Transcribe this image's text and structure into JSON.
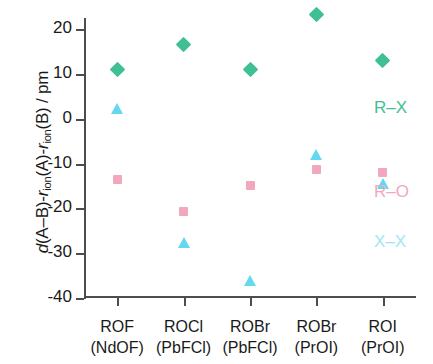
{
  "chart_data": {
    "type": "scatter",
    "title": "",
    "xlabel": "",
    "ylabel": "d(A-B)-r_ion(A)-r_ion(B) / pm",
    "ylabel_parts": {
      "italic_d": "d",
      "rest_1": "(A–B)-",
      "r_1": "r",
      "sub_1": "ion",
      "rest_2": "(A)-",
      "r_2": "r",
      "sub_2": "ion",
      "rest_3": "(B) / pm"
    },
    "categories": [
      {
        "line1": "ROF",
        "line2": "(NdOF)"
      },
      {
        "line1": "ROCl",
        "line2": "(PbFCl)"
      },
      {
        "line1": "ROBr",
        "line2": "(PbFCl)"
      },
      {
        "line1": "ROBr",
        "line2": "(PrOI)"
      },
      {
        "line1": "ROI",
        "line2": "(PrOI)"
      }
    ],
    "ylim": [
      -40,
      20
    ],
    "yticks": [
      20,
      10,
      0,
      -10,
      -20,
      -30,
      -40
    ],
    "ytick_labels": [
      "20",
      "10",
      "0",
      "-10",
      "-20",
      "-30",
      "-40"
    ],
    "grid": false,
    "legend_position": "right-inside",
    "series": [
      {
        "name": "R–X",
        "marker": "diamond",
        "color": "#3fbf93",
        "values": [
          11.0,
          16.6,
          11.0,
          23.3,
          13.0
        ]
      },
      {
        "name": "R–O",
        "marker": "square",
        "color": "#f2a7bd",
        "values": [
          -13.5,
          -20.8,
          -15.0,
          -11.3,
          -12.0
        ]
      },
      {
        "name": "X–X",
        "marker": "triangle",
        "color": "#63d8f0",
        "values": [
          2.2,
          -27.7,
          -36.3,
          -8.0,
          -14.5
        ]
      }
    ],
    "legend": [
      {
        "label": "R–X",
        "color": "#3fbf93"
      },
      {
        "label": "R–O",
        "color": "#f2a7bd"
      },
      {
        "label": "X–X",
        "color": "#9ee8f5"
      }
    ]
  }
}
